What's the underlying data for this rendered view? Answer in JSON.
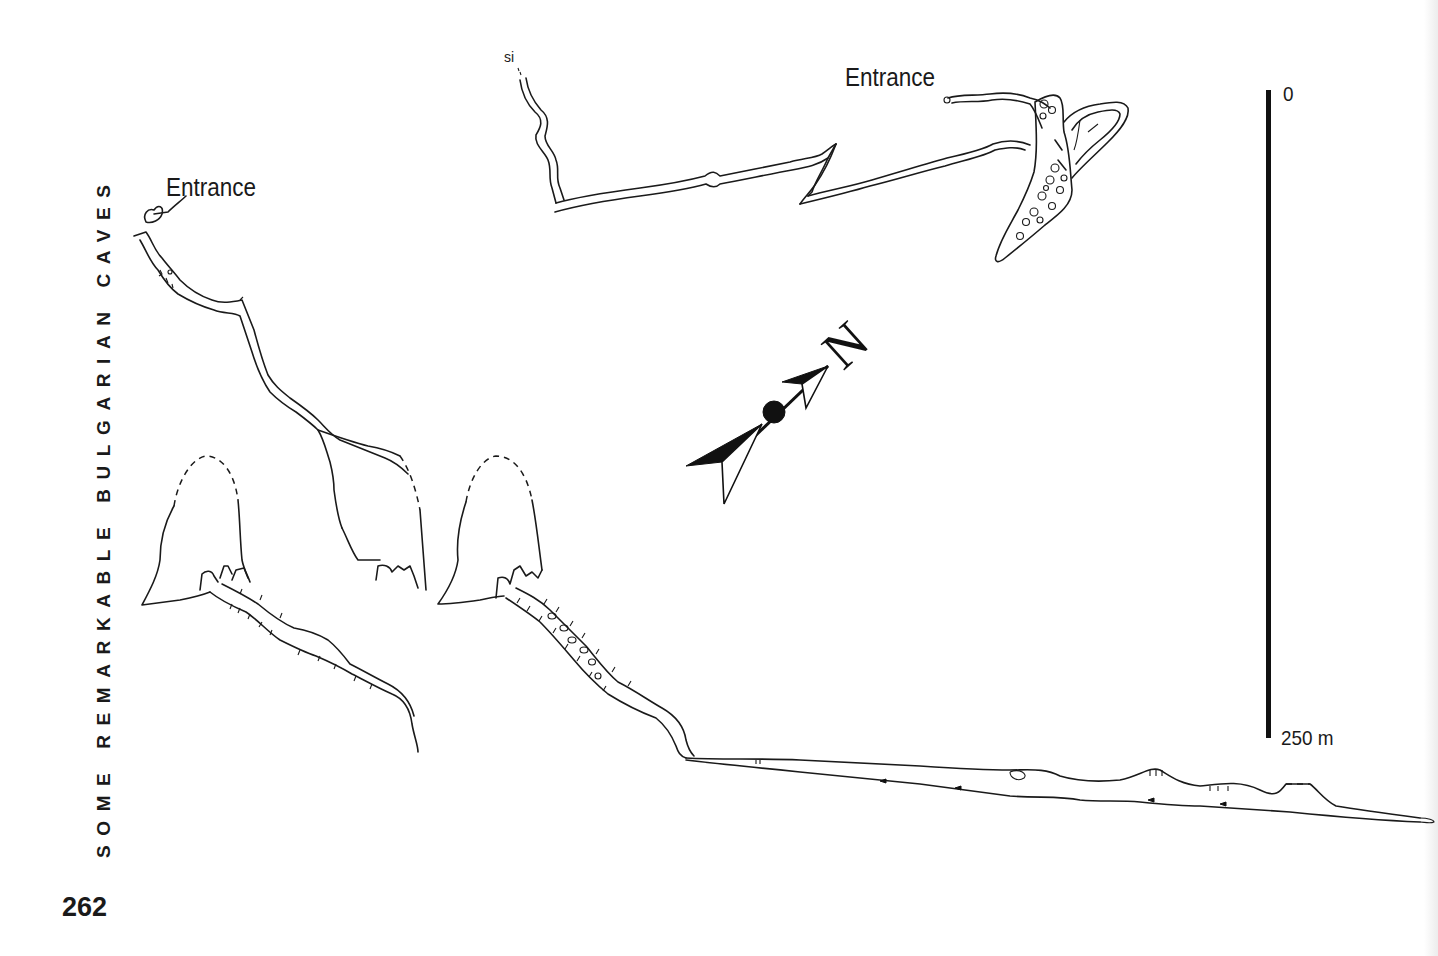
{
  "page": {
    "running_head": "SOME REMARKABLE BULGARIAN CAVES",
    "page_number": "262"
  },
  "plan_view": {
    "entrance_label": "Entrance",
    "sump_label": "si"
  },
  "profile_view": {
    "entrance_label": "Entrance"
  },
  "north_arrow": {
    "label": "N",
    "icon": "north-arrow-icon"
  },
  "scale_bar": {
    "top_label": "0",
    "bottom_label": "250 m",
    "length_m": 250
  },
  "colors": {
    "ink": "#1a1a1a",
    "paper": "#ffffff"
  }
}
